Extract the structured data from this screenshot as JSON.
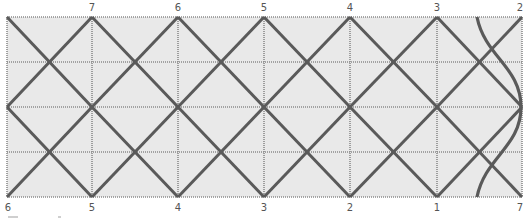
{
  "diagram": {
    "type": "folding-pattern-grid",
    "colors": {
      "background": "#e9e9e9",
      "grid": "#8a8a8a",
      "fold_line": "#5a5a5a",
      "label": "#555555"
    },
    "frame": {
      "left": 7,
      "top": 17,
      "right": 522,
      "bottom": 197
    },
    "columns_x": [
      7,
      92,
      178,
      264,
      350,
      437,
      522
    ],
    "rows_y": [
      17,
      62,
      107,
      152,
      197
    ],
    "top_labels": [
      {
        "text": "7",
        "x": 92
      },
      {
        "text": "6",
        "x": 178
      },
      {
        "text": "5",
        "x": 264
      },
      {
        "text": "4",
        "x": 350
      },
      {
        "text": "3",
        "x": 437
      },
      {
        "text": "2",
        "x": 522
      }
    ],
    "bottom_labels": [
      {
        "text": "6",
        "x": 7
      },
      {
        "text": "5",
        "x": 92
      },
      {
        "text": "4",
        "x": 178
      },
      {
        "text": "3",
        "x": 264
      },
      {
        "text": "2",
        "x": 350
      },
      {
        "text": "1",
        "x": 437
      },
      {
        "text": "7",
        "x": 522
      }
    ],
    "curve": {
      "start": [
        477,
        17
      ],
      "apex": [
        521,
        107
      ],
      "end": [
        477,
        197
      ]
    }
  }
}
